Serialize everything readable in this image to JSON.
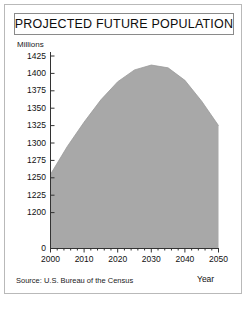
{
  "title": "PROJECTED FUTURE POPULATION",
  "units_label": "Millions",
  "source_note": "Source: U.S. Bureau of the Census",
  "year_axis_label": "Year",
  "colors": {
    "area_fill": "#a8a8a8",
    "axis": "#333333",
    "frame": "#b9b9b9",
    "title_border": "#8a8a8a",
    "text": "#111111",
    "background": "#ffffff"
  },
  "chart_data": {
    "type": "area",
    "title": "PROJECTED FUTURE POPULATION",
    "xlabel": "Year",
    "ylabel": "Millions",
    "xlim": [
      2000,
      2050
    ],
    "ylim": [
      1175,
      1425
    ],
    "y_axis_break": true,
    "y_break_value": 0,
    "grid": false,
    "legend": null,
    "x_ticks": [
      2000,
      2010,
      2020,
      2030,
      2040,
      2050
    ],
    "x_minor_tick_step": 2,
    "y_ticks": [
      1200,
      1225,
      1250,
      1275,
      1300,
      1325,
      1350,
      1375,
      1400,
      1425
    ],
    "y_tick_labels": [
      "0",
      "1200",
      "1225",
      "1250",
      "1275",
      "1300",
      "1325",
      "1350",
      "1375",
      "1400",
      "1425"
    ],
    "x": [
      2000,
      2005,
      2010,
      2015,
      2020,
      2025,
      2030,
      2035,
      2040,
      2045,
      2050
    ],
    "values": [
      1255,
      1295,
      1330,
      1362,
      1388,
      1405,
      1412,
      1408,
      1390,
      1360,
      1325
    ],
    "series": [
      {
        "name": "Projected population",
        "values": [
          1255,
          1295,
          1330,
          1362,
          1388,
          1405,
          1412,
          1408,
          1390,
          1360,
          1325
        ]
      }
    ]
  }
}
